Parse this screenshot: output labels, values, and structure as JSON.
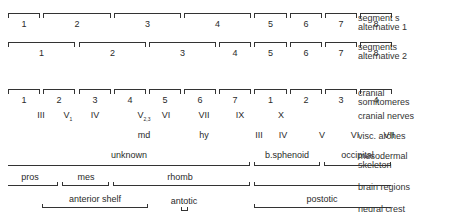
{
  "rows": {
    "segments_alt1": {
      "label_line1": "segment s",
      "label_line2": "alternative 1",
      "segments": [
        {
          "label": "1",
          "x1": 8,
          "x2": 40
        },
        {
          "label": "2",
          "x1": 43,
          "x2": 111
        },
        {
          "label": "3",
          "x1": 114,
          "x2": 181
        },
        {
          "label": "4",
          "x1": 184,
          "x2": 251
        },
        {
          "label": "5",
          "x1": 254,
          "x2": 287
        },
        {
          "label": "6",
          "x1": 290,
          "x2": 322
        },
        {
          "label": "7",
          "x1": 325,
          "x2": 357
        },
        {
          "label": "8",
          "x1": 360,
          "x2": 392
        }
      ]
    },
    "segments_alt2": {
      "label_line1": "segments",
      "label_line2": "alternative 2",
      "segments": [
        {
          "label": "1",
          "x1": 8,
          "x2": 75
        },
        {
          "label": "2",
          "x1": 79,
          "x2": 146
        },
        {
          "label": "3",
          "x1": 149,
          "x2": 216
        },
        {
          "label": "4",
          "x1": 219,
          "x2": 251
        },
        {
          "label": "5",
          "x1": 254,
          "x2": 287
        },
        {
          "label": "6",
          "x1": 290,
          "x2": 322
        },
        {
          "label": "7",
          "x1": 325,
          "x2": 357
        },
        {
          "label": "8",
          "x1": 360,
          "x2": 392
        }
      ]
    },
    "cranial_somitomeres": {
      "label_line1": "cranial",
      "label_line2": "somitomeres",
      "segments": [
        {
          "label": "1",
          "x1": 8,
          "x2": 40
        },
        {
          "label": "2",
          "x1": 43,
          "x2": 75
        },
        {
          "label": "3",
          "x1": 79,
          "x2": 111
        },
        {
          "label": "4",
          "x1": 114,
          "x2": 146
        },
        {
          "label": "5",
          "x1": 149,
          "x2": 181
        },
        {
          "label": "6",
          "x1": 184,
          "x2": 216
        },
        {
          "label": "7",
          "x1": 219,
          "x2": 251
        },
        {
          "label": "1",
          "x1": 254,
          "x2": 287
        },
        {
          "label": "2",
          "x1": 290,
          "x2": 322
        },
        {
          "label": "3",
          "x1": 325,
          "x2": 357
        },
        {
          "label": "4",
          "x1": 360,
          "x2": 392
        }
      ]
    },
    "cranial_nerves": {
      "label": "cranial nerves",
      "items": [
        {
          "label": "III",
          "x": 41
        },
        {
          "label": "V",
          "sub": "1",
          "x": 68
        },
        {
          "label": "IV",
          "x": 95
        },
        {
          "label": "V",
          "sub": "2,3",
          "x": 144
        },
        {
          "label": "VI",
          "x": 166
        },
        {
          "label": "VII",
          "x": 204
        },
        {
          "label": "IX",
          "x": 240
        },
        {
          "label": "X",
          "x": 281
        }
      ]
    },
    "visc_arches": {
      "label": "visc. arches",
      "items": [
        {
          "label": "md",
          "x": 144
        },
        {
          "label": "hy",
          "x": 204
        },
        {
          "label": "III",
          "x": 259
        },
        {
          "label": "IV",
          "x": 283
        },
        {
          "label": "V",
          "x": 322
        },
        {
          "label": "VI",
          "x": 355
        },
        {
          "label": "VII",
          "x": 389
        }
      ]
    },
    "mesodermal_skeleton": {
      "label_line1": "mesodermal",
      "label_line2": "skeleton",
      "spans": [
        {
          "label": "unknown",
          "x1": 8,
          "x2": 250,
          "open_left": true
        },
        {
          "label": "b.sphenoid",
          "x1": 254,
          "x2": 320
        },
        {
          "label": "occipital",
          "x1": 324,
          "x2": 391
        }
      ]
    },
    "brain_regions": {
      "label": "brain regions",
      "spans": [
        {
          "label": "pros",
          "x1": 8,
          "x2": 58,
          "open_left": true
        },
        {
          "label": "mes",
          "x1": 62,
          "x2": 109
        },
        {
          "label": "rhomb",
          "x1": 113,
          "x2": 250,
          "open_right_to": 391
        },
        {
          "label": "",
          "x1": 254,
          "x2": 391,
          "open_right": true
        }
      ]
    },
    "neural_crest": {
      "label": "neural crest",
      "spans": [
        {
          "label": "anterior   shelf",
          "x1": 42,
          "x2": 148
        },
        {
          "label": "antotic",
          "x1": 181,
          "x2": 188
        },
        {
          "label": "postotic",
          "x1": 254,
          "x2": 391,
          "open_right": true
        }
      ]
    }
  }
}
